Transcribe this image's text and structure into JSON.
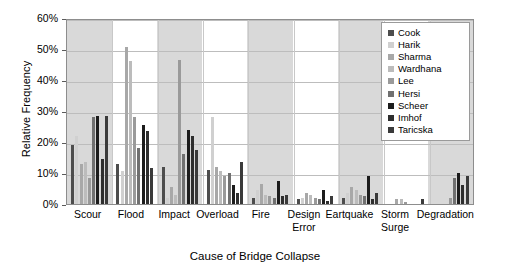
{
  "chart_data": {
    "type": "bar",
    "title": "",
    "xlabel": "Cause of Bridge Collapse",
    "ylabel": "Relative Frequency",
    "ylim": [
      0,
      60
    ],
    "ytick_labels": [
      "0%",
      "10%",
      "20%",
      "30%",
      "40%",
      "50%",
      "60%"
    ],
    "ytick_values": [
      0,
      10,
      20,
      30,
      40,
      50,
      60
    ],
    "grid": true,
    "legend_position": "top-right",
    "categories": [
      "Scour",
      "Flood",
      "Impact",
      "Overload",
      "Fire",
      "Design\nError",
      "Eartquake",
      "Storm\nSurge",
      "Degradation"
    ],
    "category_display": [
      "Scour",
      "Flood",
      "Impact",
      "Overload",
      "Fire",
      "Design Error",
      "Eartquake",
      "Storm Surge",
      "Degradation"
    ],
    "series": [
      {
        "name": "Cook",
        "color": "#4d4d4d",
        "values": [
          19.0,
          13.0,
          12.0,
          11.0,
          2.0,
          1.5,
          2.0,
          0.0,
          0.0
        ]
      },
      {
        "name": "Harik",
        "color": "#d0d0d0",
        "values": [
          22.0,
          10.5,
          2.0,
          28.0,
          4.5,
          2.0,
          3.5,
          0.0,
          0.0
        ]
      },
      {
        "name": "Sharma",
        "color": "#a8a8a8",
        "values": [
          13.0,
          50.5,
          5.5,
          12.0,
          6.5,
          3.5,
          5.5,
          1.5,
          0.0
        ]
      },
      {
        "name": "Wardhana",
        "color": "#bcbcbc",
        "values": [
          13.5,
          46.0,
          3.0,
          10.5,
          3.0,
          3.0,
          4.5,
          1.5,
          0.0
        ]
      },
      {
        "name": "Lee",
        "color": "#9a9a9a",
        "values": [
          8.5,
          28.0,
          46.5,
          9.0,
          2.5,
          2.0,
          3.0,
          0.5,
          2.0
        ]
      },
      {
        "name": "Hersi",
        "color": "#707070",
        "values": [
          28.0,
          18.0,
          16.0,
          10.0,
          2.0,
          1.5,
          2.5,
          0.0,
          8.5
        ]
      },
      {
        "name": "Scheer",
        "color": "#1c1c1c",
        "values": [
          28.5,
          25.5,
          24.0,
          6.0,
          7.5,
          4.5,
          9.0,
          0.0,
          10.0
        ]
      },
      {
        "name": "Imhof",
        "color": "#2e2e2e",
        "values": [
          14.5,
          23.5,
          22.0,
          3.5,
          2.5,
          1.0,
          1.5,
          0.0,
          6.0
        ]
      },
      {
        "name": "Taricska",
        "color": "#3a3a3a",
        "values": [
          28.5,
          11.5,
          17.5,
          13.5,
          3.0,
          2.5,
          3.5,
          1.5,
          9.0
        ]
      }
    ]
  },
  "style": {
    "band_shade": "#d9d9d9",
    "band_plain": "#ffffff",
    "grid_color": "#bdbdbd",
    "axis_color": "#8d8d8d",
    "plot_background": "#ffffff"
  }
}
